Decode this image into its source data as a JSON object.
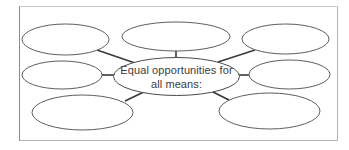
{
  "diagram": {
    "type": "spider-diagram",
    "center": {
      "line1": "Equal opportunities for",
      "line2": "all means:"
    },
    "branches": [
      {
        "id": "top-left",
        "text": ""
      },
      {
        "id": "top-center",
        "text": ""
      },
      {
        "id": "top-right",
        "text": ""
      },
      {
        "id": "middle-left",
        "text": ""
      },
      {
        "id": "middle-right",
        "text": ""
      },
      {
        "id": "bottom-left",
        "text": ""
      },
      {
        "id": "bottom-right",
        "text": ""
      }
    ],
    "colors": {
      "connector": "#3a3a3a",
      "bubble_outline": "#5e5e5e",
      "text": "#3c3c3c",
      "frame": "#b4b4b4"
    }
  }
}
